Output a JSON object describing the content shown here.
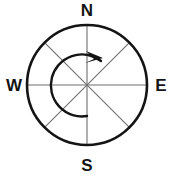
{
  "diagram": {
    "type": "compass-rose",
    "background_color": "#ffffff",
    "canvas": {
      "width": 173,
      "height": 181
    }
  },
  "circle": {
    "center_x": 87,
    "center_y": 85,
    "radius": 60,
    "stroke_color": "#141414",
    "stroke_width": 2.6,
    "fill": "none"
  },
  "spokes": {
    "stroke_color": "#6e6e6e",
    "stroke_width": 1.1,
    "count": 4,
    "angles_deg": [
      0,
      45,
      90,
      135
    ],
    "lines": [
      {
        "name": "north-south-axis",
        "x1": 87,
        "y1": 25,
        "x2": 87,
        "y2": 145
      },
      {
        "name": "west-east-axis",
        "x1": 27,
        "y1": 85,
        "x2": 147,
        "y2": 85
      },
      {
        "name": "northeast-southwest-diagonal",
        "x1": 129.4,
        "y1": 42.6,
        "x2": 44.6,
        "y2": 127.4
      },
      {
        "name": "northwest-southeast-diagonal",
        "x1": 44.6,
        "y1": 42.6,
        "x2": 129.4,
        "y2": 127.4
      }
    ]
  },
  "rotation_arc": {
    "direction": "counterclockwise",
    "radius": 31,
    "start_angle_deg": 270,
    "end_angle_deg": 60,
    "stroke_color": "#141414",
    "stroke_width": 2.4,
    "path": "M 87 116 A 31 31 0 1 1 101 61",
    "arrowhead_points": "103,58 86,51 94,59 85,63",
    "arrowhead_tip_x": 104,
    "arrowhead_tip_y": 57
  },
  "labels": {
    "north": {
      "text": "N",
      "x": 87,
      "y": 12
    },
    "west": {
      "text": "W",
      "x": 14,
      "y": 87
    },
    "east": {
      "text": "E",
      "x": 161,
      "y": 87
    },
    "south": {
      "text": "S",
      "x": 87,
      "y": 167
    }
  }
}
